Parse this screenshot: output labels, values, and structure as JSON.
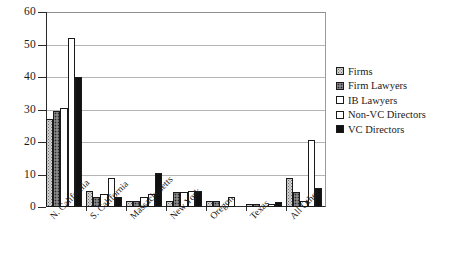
{
  "chart_data": {
    "type": "bar",
    "title": "",
    "xlabel": "",
    "ylabel": "",
    "ylim": [
      0,
      60
    ],
    "yticks": [
      0,
      10,
      20,
      30,
      40,
      50,
      60
    ],
    "grid": true,
    "legend_position": "right",
    "categories": [
      "N. California",
      "S. California",
      "Massachusetts",
      "New York",
      "Oregon",
      "Texas",
      "All Other"
    ],
    "series": [
      {
        "name": "Firms",
        "swatch": "#d4d4d4",
        "pattern": "light-dotted",
        "values": [
          27,
          5,
          2,
          2,
          2,
          1,
          9
        ]
      },
      {
        "name": "Firm Lawyers",
        "swatch": "#6d6d6d",
        "pattern": "dark-dotted",
        "values": [
          29.5,
          3,
          2,
          4.5,
          2,
          1,
          4.5
        ]
      },
      {
        "name": "IB Lawyers",
        "swatch": "#ffffff",
        "pattern": "solid",
        "values": [
          30.5,
          4,
          3,
          4.5,
          0,
          0,
          2
        ]
      },
      {
        "name": "Non-VC Directors",
        "swatch": "#ffffff",
        "pattern": "solid",
        "values": [
          52,
          9,
          4,
          5,
          3,
          1,
          20.5
        ]
      },
      {
        "name": "VC Directors",
        "swatch": "#111111",
        "pattern": "solid",
        "values": [
          40,
          3,
          10.5,
          5,
          0,
          1.5,
          6
        ]
      }
    ]
  },
  "legend": {
    "items": [
      {
        "label": "Firms"
      },
      {
        "label": "Firm Lawyers"
      },
      {
        "label": "IB Lawyers"
      },
      {
        "label": "Non-VC Directors"
      },
      {
        "label": "VC Directors"
      }
    ]
  },
  "axis": {
    "y_tick_labels": [
      "60",
      "50",
      "40",
      "30",
      "20",
      "10",
      "0"
    ]
  }
}
